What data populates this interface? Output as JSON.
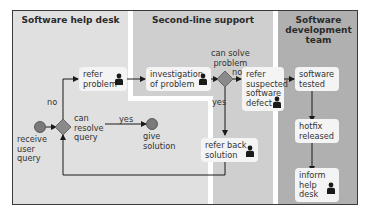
{
  "lanes": [
    {
      "title": "Software help desk",
      "color": "#e0e0e0"
    },
    {
      "title": "Second-line support",
      "color": "#cfcfcf"
    },
    {
      "title": "Software\ndevelopment\nteam",
      "title_lines": [
        "Software",
        "development",
        "team"
      ],
      "color": "#b0b0b0"
    }
  ],
  "nodes": {
    "receive_user_query": {
      "lines": [
        "receive",
        "user",
        "query"
      ],
      "type": "start-event"
    },
    "can_resolve_query": {
      "lines": [
        "can",
        "resolve",
        "query"
      ],
      "type": "gateway"
    },
    "give_solution": {
      "lines": [
        "give",
        "solution"
      ],
      "type": "end-event"
    },
    "refer_problem": {
      "lines": [
        "refer",
        "problem"
      ],
      "type": "task",
      "performer": true
    },
    "investigation_of_problem": {
      "lines": [
        "investigation",
        "of problem"
      ],
      "type": "task",
      "performer": true
    },
    "can_solve_problem": {
      "lines": [
        "can solve",
        "problem"
      ],
      "type": "gateway"
    },
    "refer_suspected_software_defect": {
      "lines": [
        "refer",
        "suspected",
        "software",
        "defect"
      ],
      "type": "task",
      "performer": true
    },
    "refer_back_solution": {
      "lines": [
        "refer back",
        "solution"
      ],
      "type": "task",
      "performer": true
    },
    "software_tested": {
      "lines": [
        "software",
        "tested"
      ],
      "type": "task",
      "performer": false
    },
    "hotfix_released": {
      "lines": [
        "hotfix",
        "released"
      ],
      "type": "task",
      "performer": false
    },
    "inform_help_desk": {
      "lines": [
        "inform",
        "help",
        "desk"
      ],
      "type": "task",
      "performer": true
    }
  },
  "edge_labels": {
    "no_help_desk": "no",
    "yes_help_desk": "yes",
    "no_second_line": "no",
    "yes_second_line": "yes"
  },
  "colors": {
    "gateway": "#8a8a8a",
    "event": "#7a7a7a",
    "task_bg": "#f4f4f4",
    "line": "#1a1a1a",
    "border": "#3a3a3a"
  }
}
